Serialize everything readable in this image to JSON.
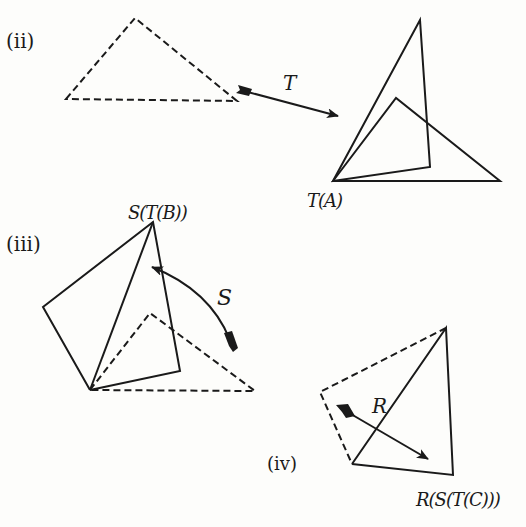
{
  "panels": {
    "ii": {
      "label": "(ii)",
      "transform_label": "T",
      "result_label": "T(A)"
    },
    "iii": {
      "label": "(iii)",
      "transform_label": "S",
      "result_label": "S(T(B))"
    },
    "iv": {
      "label": "(iv)",
      "transform_label": "R",
      "result_label": "R(S(T(C)))"
    }
  },
  "colors": {
    "ink": "#1a1a1a",
    "background": "#fdfdfb"
  }
}
